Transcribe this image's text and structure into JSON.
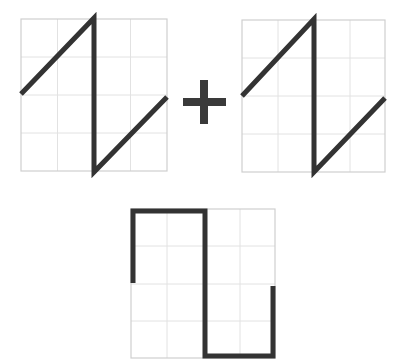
{
  "diagram": {
    "operator": "+",
    "colors": {
      "grid": "#d4d4d4",
      "border": "#cfcfcf",
      "stroke": "#333333",
      "background": "#ffffff"
    },
    "panels": [
      {
        "id": "sawtooth-a",
        "label": "Sawtooth wave A",
        "grid": {
          "x": 21,
          "y": 19,
          "w": 146,
          "h": 152,
          "cols": 4,
          "rows": 4
        }
      },
      {
        "id": "sawtooth-b",
        "label": "Sawtooth wave B",
        "grid": {
          "x": 242,
          "y": 20,
          "w": 143,
          "h": 152,
          "cols": 4,
          "rows": 4
        }
      },
      {
        "id": "square-result",
        "label": "Resulting square wave",
        "grid": {
          "x": 131,
          "y": 209,
          "w": 144,
          "h": 149,
          "cols": 4,
          "rows": 4
        }
      }
    ]
  }
}
